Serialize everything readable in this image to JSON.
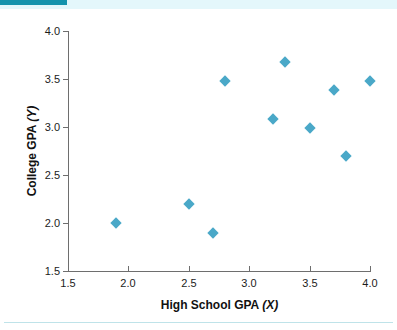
{
  "page": {
    "background_color": "#ffffff",
    "accent_color": "#1593ac",
    "top_band_color": "#e4f7fb",
    "rule_color": "#bfe3e9"
  },
  "chart_data": {
    "type": "scatter",
    "title": "",
    "xlabel": "High School GPA (X)",
    "xlabel_text": "High School GPA ",
    "xlabel_var": "(X)",
    "ylabel": "College GPA (Y)",
    "ylabel_text": "College GPA ",
    "ylabel_var": "(Y)",
    "xlim": [
      1.5,
      4.0
    ],
    "ylim": [
      1.5,
      4.0
    ],
    "xticks": [
      1.5,
      2.0,
      2.5,
      3.0,
      3.5,
      4.0
    ],
    "yticks": [
      1.5,
      2.0,
      2.5,
      3.0,
      3.5,
      4.0
    ],
    "xticklabels": [
      "1.5",
      "2.0",
      "2.5",
      "3.0",
      "3.5",
      "4.0"
    ],
    "yticklabels": [
      "1.5",
      "2.0",
      "2.5",
      "3.0",
      "3.5",
      "4.0"
    ],
    "grid": false,
    "legend": false,
    "marker": "diamond",
    "marker_color": "#4aa8c8",
    "series": [
      {
        "name": "Students",
        "points": [
          {
            "x": 1.9,
            "y": 2.0
          },
          {
            "x": 2.5,
            "y": 2.2
          },
          {
            "x": 2.7,
            "y": 1.9
          },
          {
            "x": 2.8,
            "y": 3.48
          },
          {
            "x": 3.2,
            "y": 3.08
          },
          {
            "x": 3.3,
            "y": 3.68
          },
          {
            "x": 3.5,
            "y": 2.99
          },
          {
            "x": 3.7,
            "y": 3.39
          },
          {
            "x": 3.8,
            "y": 2.7
          },
          {
            "x": 4.0,
            "y": 3.48
          }
        ]
      }
    ]
  }
}
